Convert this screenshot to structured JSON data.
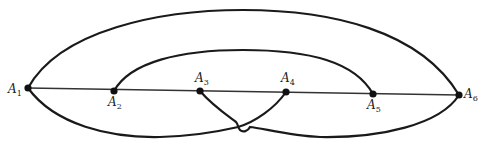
{
  "diagram": {
    "type": "graph",
    "nodes": [
      {
        "id": "A1",
        "letter": "A",
        "sub": "1",
        "x": 28,
        "y": 88,
        "label_pos": "left"
      },
      {
        "id": "A2",
        "letter": "A",
        "sub": "2",
        "x": 114,
        "y": 91,
        "label_pos": "below"
      },
      {
        "id": "A3",
        "letter": "A",
        "sub": "3",
        "x": 200,
        "y": 91,
        "label_pos": "above"
      },
      {
        "id": "A4",
        "letter": "A",
        "sub": "4",
        "x": 286,
        "y": 92,
        "label_pos": "above"
      },
      {
        "id": "A5",
        "letter": "A",
        "sub": "5",
        "x": 373,
        "y": 94,
        "label_pos": "below"
      },
      {
        "id": "A6",
        "letter": "A",
        "sub": "6",
        "x": 459,
        "y": 95,
        "label_pos": "right"
      }
    ],
    "edges": [
      {
        "from": "A1",
        "to": "A6",
        "shape": "straight"
      },
      {
        "from": "A1",
        "to": "A6",
        "shape": "arc-above-outer"
      },
      {
        "from": "A2",
        "to": "A5",
        "shape": "arc-above-inner"
      },
      {
        "from": "A1",
        "to": "A4",
        "shape": "curve-below"
      },
      {
        "from": "A3",
        "to": "A6",
        "shape": "curve-below"
      }
    ],
    "crossings": [
      {
        "between": [
          "A1-A4",
          "A3-A6"
        ],
        "x": 241,
        "y": 127,
        "style": "hop"
      }
    ],
    "colors": {
      "stroke": "#1a1a1a",
      "node": "#111111",
      "background": "#ffffff"
    }
  }
}
